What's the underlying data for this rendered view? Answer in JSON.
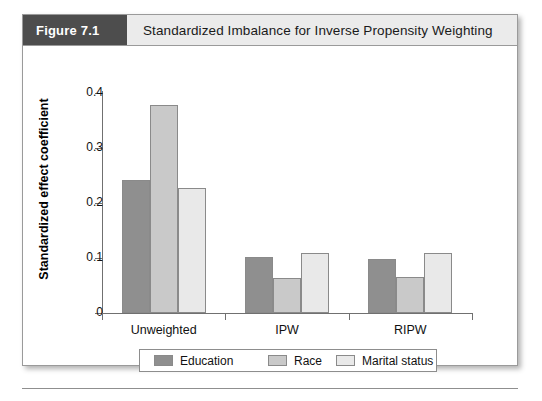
{
  "figure": {
    "number_label": "Figure 7.1",
    "title": "Standardized Imbalance for Inverse Propensity Weighting"
  },
  "chart_data": {
    "type": "bar",
    "title": "Standardized Imbalance for Inverse Propensity Weighting",
    "xlabel": "",
    "ylabel": "Standardized effect coefficient",
    "categories": [
      "Unweighted",
      "IPW",
      "RIPW"
    ],
    "series": [
      {
        "name": "Education",
        "color": "#8f8f8f",
        "values": [
          0.242,
          0.102,
          0.098
        ]
      },
      {
        "name": "Race",
        "color": "#c9c9c9",
        "values": [
          0.378,
          0.063,
          0.065
        ]
      },
      {
        "name": "Marital status",
        "color": "#e9e9e9",
        "values": [
          0.228,
          0.11,
          0.11
        ]
      }
    ],
    "ylim": [
      0,
      0.4
    ],
    "yticks": [
      "0",
      "0.1",
      "0.2",
      "0.3",
      "0.4"
    ],
    "ytick_values": [
      0,
      0.1,
      0.2,
      0.3,
      0.4
    ],
    "grid": false,
    "legend_position": "bottom"
  },
  "colors": {
    "header_band": "#ebebeb",
    "figure_number_block": "#4d4d4d",
    "axis": "#707070",
    "bar_education": "#8f8f8f",
    "bar_race": "#c9c9c9",
    "bar_marital": "#e9e9e9"
  }
}
